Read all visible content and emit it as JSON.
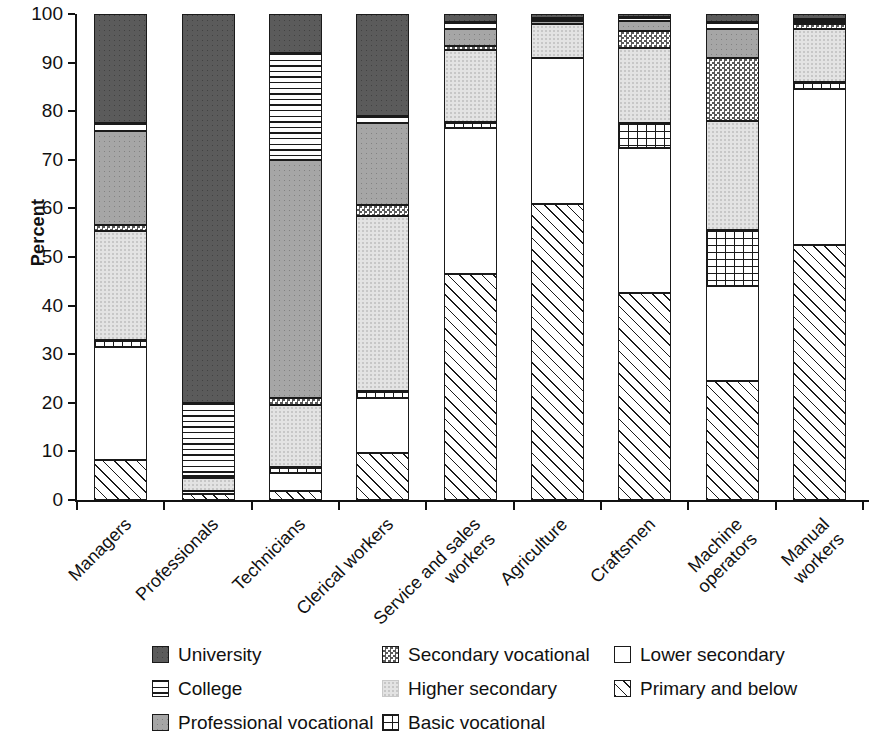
{
  "chart_data": {
    "type": "bar",
    "subtype": "stacked-bar-100",
    "title": "",
    "xlabel": "",
    "ylabel": "Percent",
    "ylim": [
      0,
      100
    ],
    "yticks": [
      0,
      10,
      20,
      30,
      40,
      50,
      60,
      70,
      80,
      90,
      100
    ],
    "ytick_labels": [
      "0",
      "10",
      "20",
      "30",
      "40",
      "50",
      "60",
      "70",
      "80",
      "90",
      "100"
    ],
    "grid": false,
    "legend_position": "bottom",
    "categories": [
      "Managers",
      "Professionals",
      "Technicians",
      "Clerical workers",
      "Service and sales\nworkers",
      "Agriculture",
      "Craftsmen",
      "Machine\noperators",
      "Manual\nworkers"
    ],
    "stack_order_bottom_to_top": [
      "Primary and below",
      "Lower secondary",
      "Basic vocational",
      "Higher secondary",
      "Secondary vocational",
      "Professional vocational",
      "College",
      "University"
    ],
    "series": [
      {
        "name": "Primary and below",
        "pattern": "diagonal-hatch",
        "values": [
          8.3,
          1.2,
          1.8,
          9.7,
          46.5,
          61.0,
          42.5,
          24.5,
          52.5
        ]
      },
      {
        "name": "Lower secondary",
        "pattern": "empty-white",
        "values": [
          23.2,
          0.6,
          3.7,
          11.3,
          30.0,
          30.0,
          30.0,
          19.5,
          32.0
        ]
      },
      {
        "name": "Basic vocational",
        "pattern": "grid",
        "values": [
          1.5,
          0.0,
          1.3,
          1.5,
          1.2,
          0.0,
          5.0,
          11.5,
          1.5
        ]
      },
      {
        "name": "Higher secondary",
        "pattern": "light-stipple",
        "values": [
          22.3,
          2.7,
          12.7,
          36.0,
          14.8,
          7.0,
          15.5,
          22.5,
          11.0
        ]
      },
      {
        "name": "Secondary vocational",
        "pattern": "checkerboard",
        "values": [
          1.2,
          0.5,
          1.5,
          2.3,
          1.0,
          0.0,
          3.5,
          13.0,
          1.0
        ]
      },
      {
        "name": "Professional vocational",
        "pattern": "medium-stipple",
        "values": [
          19.5,
          0.0,
          49.0,
          16.7,
          3.5,
          0.6,
          2.0,
          6.0,
          0.4
        ]
      },
      {
        "name": "College",
        "pattern": "horizontal-lines",
        "values": [
          1.5,
          15.0,
          22.0,
          1.5,
          1.3,
          0.5,
          0.8,
          1.3,
          0.5
        ]
      },
      {
        "name": "University",
        "pattern": "dark-solid",
        "values": [
          22.5,
          80.0,
          8.0,
          21.0,
          1.7,
          0.9,
          0.7,
          1.7,
          1.1
        ]
      }
    ]
  },
  "legend": {
    "entries": [
      {
        "label": "University",
        "swatch": "dark-solid-swatch",
        "col": 0,
        "row": 0
      },
      {
        "label": "College",
        "swatch": "horizontal-lines-swatch",
        "col": 0,
        "row": 1
      },
      {
        "label": "Professional vocational",
        "swatch": "medium-stipple-swatch",
        "col": 0,
        "row": 2
      },
      {
        "label": "Secondary vocational",
        "swatch": "checkerboard-swatch",
        "col": 1,
        "row": 0
      },
      {
        "label": "Higher secondary",
        "swatch": "light-stipple-swatch",
        "col": 1,
        "row": 1
      },
      {
        "label": "Basic vocational",
        "swatch": "grid-swatch",
        "col": 1,
        "row": 2
      },
      {
        "label": "Lower secondary",
        "swatch": "empty-white-swatch",
        "col": 2,
        "row": 0
      },
      {
        "label": "Primary and below",
        "swatch": "diagonal-hatch-swatch",
        "col": 2,
        "row": 1
      }
    ]
  },
  "colors": {
    "university": "#5b5b5b",
    "professional_vocational": "#a6a6a6",
    "higher_secondary": "#e3e3e3",
    "secondary_vocational": "#5a5a5a",
    "outline": "#1a1a1a",
    "background": "#ffffff"
  }
}
